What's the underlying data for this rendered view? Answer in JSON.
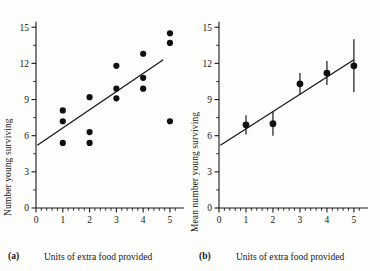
{
  "figure": {
    "background_color": "#fdfdfc",
    "ink_color": "#101010"
  },
  "panels": [
    {
      "tag": "(a)",
      "xlabel": "Units of extra food provided",
      "ylabel": "Number young surviving"
    },
    {
      "tag": "(b)",
      "xlabel": "Units of extra food provided",
      "ylabel": "Mean number young surviving"
    }
  ],
  "axis_ticks": {
    "x_major": [
      "0",
      "1",
      "2",
      "3",
      "4",
      "5"
    ],
    "y_major": [
      "0",
      "3",
      "6",
      "9",
      "12",
      "15"
    ]
  },
  "chart_data": [
    {
      "type": "scatter",
      "panel": "(a)",
      "title": "",
      "xlabel": "Units of extra food provided",
      "ylabel": "Number young surviving",
      "xlim": [
        0,
        5.3
      ],
      "ylim": [
        0,
        15.6
      ],
      "xticks": [
        0,
        1,
        2,
        3,
        4,
        5
      ],
      "yticks": [
        0,
        3,
        6,
        9,
        12,
        15
      ],
      "x_minor_step": 0.2,
      "y_minor_step": 1.5,
      "grid": false,
      "legend": null,
      "points": [
        {
          "x": 1,
          "y": 8.1
        },
        {
          "x": 1,
          "y": 7.2
        },
        {
          "x": 1,
          "y": 5.4
        },
        {
          "x": 2,
          "y": 9.2
        },
        {
          "x": 2,
          "y": 6.3
        },
        {
          "x": 2,
          "y": 5.4
        },
        {
          "x": 3,
          "y": 11.8
        },
        {
          "x": 3,
          "y": 9.9
        },
        {
          "x": 3,
          "y": 9.1
        },
        {
          "x": 4,
          "y": 12.8
        },
        {
          "x": 4,
          "y": 10.8
        },
        {
          "x": 4,
          "y": 9.9
        },
        {
          "x": 5,
          "y": 14.5
        },
        {
          "x": 5,
          "y": 13.7
        },
        {
          "x": 5,
          "y": 7.2
        }
      ],
      "fit_line": {
        "x0": 0.05,
        "y0": 5.2,
        "x1": 4.75,
        "y1": 12.3
      }
    },
    {
      "type": "scatter",
      "panel": "(b)",
      "title": "",
      "xlabel": "Units of extra food provided",
      "ylabel": "Mean number young surviving",
      "xlim": [
        0,
        5.3
      ],
      "ylim": [
        0,
        15.6
      ],
      "xticks": [
        0,
        1,
        2,
        3,
        4,
        5
      ],
      "yticks": [
        0,
        3,
        6,
        9,
        12,
        15
      ],
      "x_minor_step": 0.2,
      "y_minor_step": 1.5,
      "grid": false,
      "legend": null,
      "error_bars": true,
      "points": [
        {
          "x": 1,
          "y": 6.9,
          "err": 0.8
        },
        {
          "x": 2,
          "y": 7.0,
          "err": 1.0
        },
        {
          "x": 3,
          "y": 10.3,
          "err": 0.9
        },
        {
          "x": 4,
          "y": 11.2,
          "err": 1.0
        },
        {
          "x": 5,
          "y": 11.8,
          "err": 2.2
        }
      ],
      "fit_line": {
        "x0": 0.05,
        "y0": 5.2,
        "x1": 5.0,
        "y1": 12.3
      }
    }
  ]
}
